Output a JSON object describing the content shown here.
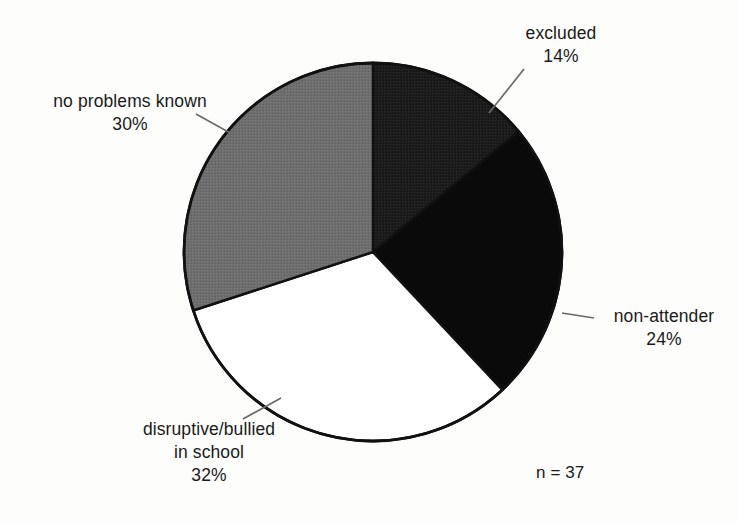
{
  "chart_data": {
    "type": "pie",
    "title": "",
    "subtitle": "",
    "xlabel": "",
    "ylabel": "",
    "grid": false,
    "legend_position": "none",
    "label_style": "outside-with-leader-lines",
    "start_angle_deg": 0,
    "direction": "clockwise",
    "sample_size_note": "n = 37",
    "categories": [
      "excluded",
      "non-attender",
      "disruptive/bullied in school",
      "no problems known"
    ],
    "values": [
      14,
      24,
      32,
      30
    ],
    "value_unit": "percent",
    "slices": [
      {
        "label": "excluded",
        "label_lines": [
          "excluded"
        ],
        "value": 14,
        "value_label": "14%",
        "color": "#1c1c1c",
        "start_deg": 0,
        "end_deg": 50.4
      },
      {
        "label": "non-attender",
        "label_lines": [
          "non-attender"
        ],
        "value": 24,
        "value_label": "24%",
        "color": "#0a0a0a",
        "start_deg": 50.4,
        "end_deg": 136.8
      },
      {
        "label": "disruptive/bullied in school",
        "label_lines": [
          "disruptive/bullied",
          "in school"
        ],
        "value": 32,
        "value_label": "32%",
        "color": "#ffffff",
        "start_deg": 136.8,
        "end_deg": 252.0
      },
      {
        "label": "no problems known",
        "label_lines": [
          "no problems known"
        ],
        "value": 30,
        "value_label": "30%",
        "color": "#6e6e6e",
        "start_deg": 252.0,
        "end_deg": 360.0
      }
    ]
  },
  "figure": {
    "background_color": "#fdfdfb",
    "outline_color": "#111111",
    "leader_line_color": "#6a6a6a",
    "text_color": "#1a1a1a",
    "note": "n = 37"
  },
  "labels": {
    "excluded": {
      "line1": "excluded",
      "pct": "14%"
    },
    "non_attender": {
      "line1": "non-attender",
      "pct": "24%"
    },
    "disruptive": {
      "line1": "disruptive/bullied",
      "line2": "in school",
      "pct": "32%"
    },
    "no_problems": {
      "line1": "no problems known",
      "pct": "30%"
    },
    "n_value": "n = 37"
  }
}
